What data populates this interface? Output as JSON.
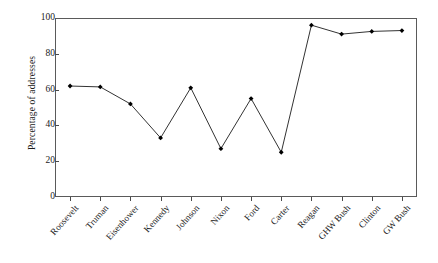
{
  "chart_data": {
    "type": "line",
    "title": "",
    "xlabel": "",
    "ylabel": "Percentage of addresses",
    "ylim": [
      0,
      100
    ],
    "yticks": [
      0,
      20,
      40,
      60,
      80,
      100
    ],
    "grid": false,
    "legend": "none",
    "frame": "box",
    "marker": "filled-diamond",
    "line_color": "#333333",
    "marker_color": "#000000",
    "categories": [
      "Roosevelt",
      "Truman",
      "Eisenhower",
      "Kennedy",
      "Johnson",
      "Nixon",
      "Ford",
      "Carter",
      "Reagan",
      "GHW Bush",
      "Clinton",
      "GW Bush"
    ],
    "values": [
      62,
      61.5,
      52,
      33,
      61,
      27,
      55,
      25,
      96,
      91,
      92.5,
      93
    ],
    "series": [
      {
        "name": "Percentage of addresses",
        "values": [
          62,
          61.5,
          52,
          33,
          61,
          27,
          55,
          25,
          96,
          91,
          92.5,
          93
        ]
      }
    ]
  },
  "axes": {
    "y_title": "Percentage of addresses",
    "y_tick_labels": [
      "100",
      "80",
      "60",
      "40",
      "20",
      "0"
    ],
    "x_tick_labels": [
      "Roosevelt",
      "Truman",
      "Eisenhower",
      "Kennedy",
      "Johnson",
      "Nixon",
      "Ford",
      "Carter",
      "Reagan",
      "GHW Bush",
      "Clinton",
      "GW Bush"
    ]
  }
}
